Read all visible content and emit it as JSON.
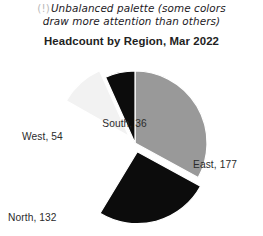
{
  "note": {
    "icon": "warning-exclamation-icon",
    "icon_glyph": "(!)",
    "line1": "Unbalanced palette (some colors",
    "line2": "draw more attention than others)"
  },
  "chart_data": {
    "type": "pie",
    "title": "Headcount by Region, Mar 2022",
    "xlabel": "",
    "ylabel": "",
    "categories": [
      "East",
      "Central",
      "North",
      "West",
      "South"
    ],
    "values": [
      177,
      138,
      132,
      54,
      36
    ],
    "total": 537,
    "labels": [
      "East, 177",
      "Central, 138",
      "North, 132",
      "West, 54",
      "South, 36"
    ],
    "slice_colors": [
      "#999999",
      "#0c0c0c",
      "#ffffff",
      "#f2f2f2",
      "#0c0c0c"
    ],
    "exploded": [
      false,
      true,
      false,
      true,
      false
    ],
    "legend": "none",
    "grid": false,
    "data_labels_position": "outside"
  }
}
